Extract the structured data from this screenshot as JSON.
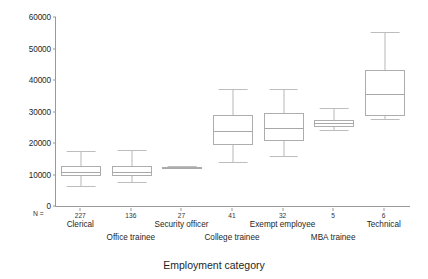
{
  "chart_data": {
    "type": "box",
    "title": "",
    "xlabel": "Employment category",
    "ylabel": "",
    "ylim": [
      0,
      60000
    ],
    "ytick_labels": [
      "0",
      "10000",
      "20000",
      "30000",
      "40000",
      "50000",
      "60000"
    ],
    "ytick_values": [
      0,
      10000,
      20000,
      30000,
      40000,
      50000,
      60000
    ],
    "grid": false,
    "legend": "none",
    "n_label": "N =",
    "categories": [
      "Clerical",
      "Office trainee",
      "Security officer",
      "College trainee",
      "Exempt employee",
      "MBA trainee",
      "Technical"
    ],
    "n_values": [
      "227",
      "136",
      "27",
      "41",
      "32",
      "5",
      "6"
    ],
    "boxes": [
      {
        "category": "Clerical",
        "whisker_low": 6300,
        "q1": 9600,
        "median": 10800,
        "q3": 12800,
        "whisker_high": 17600
      },
      {
        "category": "Office trainee",
        "whisker_low": 7600,
        "q1": 9500,
        "median": 10700,
        "q3": 12700,
        "whisker_high": 17700
      },
      {
        "category": "Security officer",
        "whisker_low": 12000,
        "q1": 12000,
        "median": 12200,
        "q3": 12500,
        "whisker_high": 12700
      },
      {
        "category": "College trainee",
        "whisker_low": 13900,
        "q1": 19400,
        "median": 23900,
        "q3": 28800,
        "whisker_high": 37300
      },
      {
        "category": "Exempt employee",
        "whisker_low": 15800,
        "q1": 20500,
        "median": 24800,
        "q3": 29400,
        "whisker_high": 37100
      },
      {
        "category": "MBA trainee",
        "whisker_low": 24000,
        "q1": 25200,
        "median": 26400,
        "q3": 27200,
        "whisker_high": 31000
      },
      {
        "category": "Technical",
        "whisker_low": 27600,
        "q1": 28700,
        "median": 35600,
        "q3": 43100,
        "whisker_high": 55100
      }
    ]
  }
}
